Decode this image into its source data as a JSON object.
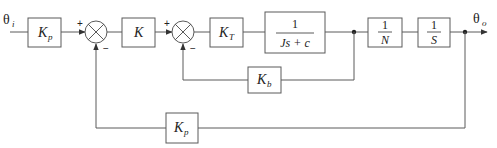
{
  "diagram": {
    "type": "control-system-block-diagram",
    "input": {
      "symbol": "θ",
      "subscript": "i"
    },
    "output": {
      "symbol": "θ",
      "subscript": "o"
    },
    "blocks": [
      {
        "id": "kp_in",
        "main": "K",
        "sub": "p"
      },
      {
        "id": "k",
        "main": "K"
      },
      {
        "id": "kt",
        "main": "K",
        "sub": "T"
      },
      {
        "id": "plant",
        "numerator": "1",
        "denominator": "Js + c"
      },
      {
        "id": "gear",
        "numerator": "1",
        "denominator": "N"
      },
      {
        "id": "integrator",
        "numerator": "1",
        "denominator": "S"
      },
      {
        "id": "kb",
        "main": "K",
        "sub": "b"
      },
      {
        "id": "kp_fb",
        "main": "K",
        "sub": "p"
      }
    ],
    "summers": [
      {
        "id": "sum1",
        "plus": "+",
        "minus": "−"
      },
      {
        "id": "sum2",
        "plus": "+",
        "minus": "−"
      }
    ],
    "colors": {
      "line": "#5a5a5a",
      "text": "#222222",
      "background": "#ffffff"
    }
  }
}
